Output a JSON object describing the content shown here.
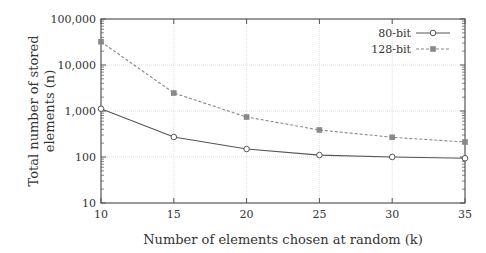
{
  "chart_data": {
    "type": "line",
    "title": "",
    "xlabel": "Number of elements chosen at random (k)",
    "ylabel": "Total number of stored elements (n)",
    "ylabel_lines": [
      "Total number of stored",
      "elements (n)"
    ],
    "yscale": "log",
    "xlim": [
      10,
      35
    ],
    "ylim": [
      10,
      100000
    ],
    "x": [
      10,
      15,
      20,
      25,
      30,
      35
    ],
    "xticks": [
      "10",
      "15",
      "20",
      "25",
      "30",
      "35"
    ],
    "yticks": [
      {
        "value": 10,
        "label": "10"
      },
      {
        "value": 100,
        "label": "100"
      },
      {
        "value": 1000,
        "label": "1,000"
      },
      {
        "value": 10000,
        "label": "10,000"
      },
      {
        "value": 100000,
        "label": "100,000"
      }
    ],
    "grid": true,
    "legend_position": "upper right",
    "series": [
      {
        "name": "80-bit",
        "values": [
          1120,
          272,
          149,
          110,
          100,
          94
        ],
        "color": "#555555",
        "line": "solid",
        "marker": "circle-open"
      },
      {
        "name": "128-bit",
        "values": [
          32000,
          2460,
          740,
          387,
          268,
          212
        ],
        "color": "#888888",
        "line": "dashed",
        "marker": "square-filled"
      }
    ]
  }
}
